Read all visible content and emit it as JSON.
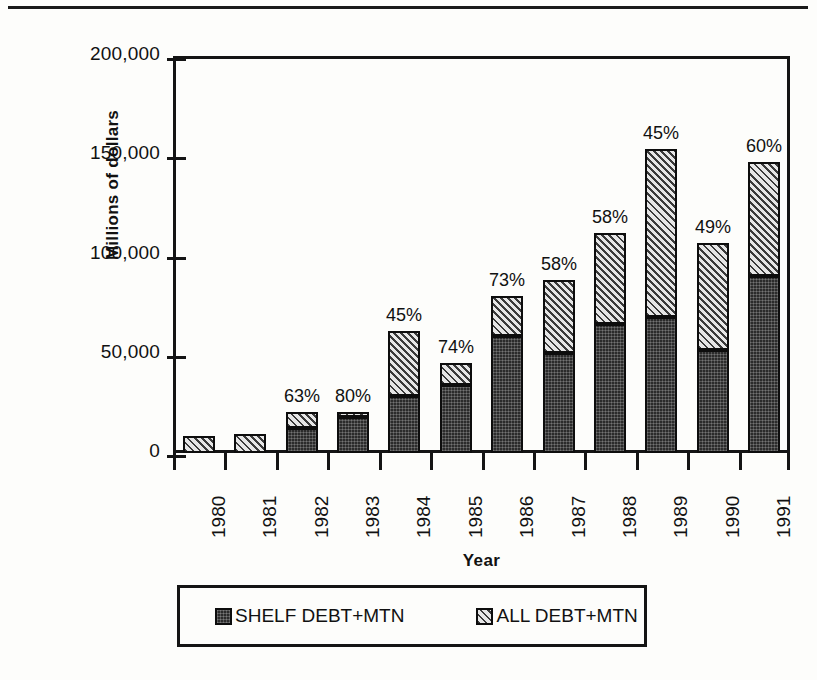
{
  "page": {
    "top_rule": "horizontal-rule"
  },
  "chart_data": {
    "type": "bar",
    "subtype": "stacked-vertical",
    "title": "",
    "xlabel": "Year",
    "ylabel": "Millions of dollars",
    "ylim": [
      0,
      200000
    ],
    "yticks": [
      0,
      50000,
      100000,
      150000,
      200000
    ],
    "ytick_labels": [
      "0",
      "50,000",
      "100,000",
      "150,000",
      "200,000"
    ],
    "grid": false,
    "legend_position": "bottom",
    "categories": [
      "1980",
      "1981",
      "1982",
      "1983",
      "1984",
      "1985",
      "1986",
      "1987",
      "1988",
      "1989",
      "1990",
      "1991"
    ],
    "series": [
      {
        "name": "SHELF DEBT+MTN",
        "fill": "solid-dark",
        "color": "#2b2b2b",
        "values": [
          0,
          0,
          12500,
          18000,
          28500,
          34000,
          59000,
          50500,
          65000,
          68500,
          52000,
          89000
        ]
      },
      {
        "name": "ALL DEBT+MTN",
        "fill": "diagonal-hatch",
        "color": "#8d8d8d",
        "values": [
          8500,
          9500,
          20500,
          20500,
          61500,
          45500,
          79000,
          87000,
          111000,
          153000,
          106000,
          146500
        ]
      }
    ],
    "annotations": {
      "note": "Percentage labels above each bar",
      "labels": [
        "",
        "",
        "63%",
        "80%",
        "45%",
        "74%",
        "73%",
        "58%",
        "58%",
        "45%",
        "49%",
        "60%"
      ]
    },
    "legend_entries": [
      {
        "label": "SHELF DEBT+MTN",
        "swatch": "solid-dark"
      },
      {
        "label": "ALL DEBT+MTN",
        "swatch": "diagonal-hatch"
      }
    ]
  }
}
